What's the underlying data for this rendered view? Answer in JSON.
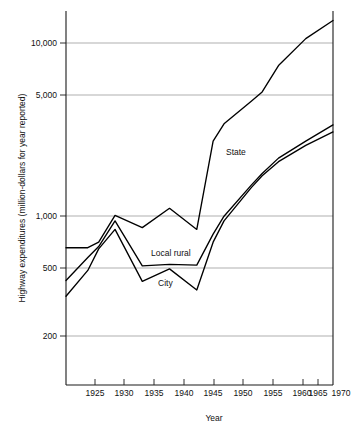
{
  "chart_data": {
    "type": "line",
    "title": "",
    "xlabel": "Year",
    "ylabel": "Highway expenditures (million-dollars for year reported)",
    "xlim": [
      1921,
      1970
    ],
    "ylim": [
      150,
      16000
    ],
    "yscale": "log",
    "grid": true,
    "legend_position": "inline-annotations",
    "ytick_labels": [
      "10,000",
      "5,000",
      "1,000",
      "500",
      "200"
    ],
    "ytick_values": [
      10000,
      5000,
      1000,
      500,
      200
    ],
    "xtick_labels": [
      "1925",
      "1930",
      "1935",
      "1940",
      "1945",
      "1950",
      "1955",
      "1960",
      "1965",
      "1970"
    ],
    "xtick_values": [
      1925,
      1930,
      1935,
      1940,
      1945,
      1950,
      1955,
      1960,
      1965,
      1970
    ],
    "x": [
      1921,
      1925,
      1927,
      1930,
      1935,
      1940,
      1945,
      1948,
      1950,
      1955,
      1957,
      1960,
      1965,
      1970
    ],
    "series": [
      {
        "name": "State",
        "label": "State",
        "values": [
          650,
          650,
          700,
          1000,
          850,
          1100,
          830,
          2700,
          3400,
          4600,
          5200,
          7400,
          10600,
          13500
        ]
      },
      {
        "name": "Local rural",
        "label": "Local rural",
        "values": [
          420,
          570,
          660,
          930,
          510,
          520,
          515,
          780,
          990,
          1500,
          1750,
          2150,
          2700,
          3350
        ]
      },
      {
        "name": "City",
        "label": "City",
        "values": [
          340,
          480,
          640,
          830,
          415,
          490,
          370,
          700,
          930,
          1450,
          1700,
          2050,
          2550,
          3050
        ]
      }
    ],
    "annotations": [
      {
        "text": "State",
        "x": 1947,
        "y": 1850
      },
      {
        "text": "Local rural",
        "x": 1936,
        "y": 620
      },
      {
        "text": "City",
        "x": 1937,
        "y": 400
      }
    ]
  },
  "axis": {
    "y_title": "Highway expenditures (million-dollars for year reported)",
    "x_title": "Year"
  },
  "yticks": {
    "t0": "10,000",
    "t1": "5,000",
    "t2": "1,000",
    "t3": "500",
    "t4": "200"
  },
  "xticks": {
    "t0": "1925",
    "t1": "1930",
    "t2": "1935",
    "t3": "1940",
    "t4": "1945",
    "t5": "1950",
    "t6": "1955",
    "t7": "1960",
    "t8": "1965",
    "t9": "1970"
  },
  "labels": {
    "state": "State",
    "local_rural": "Local rural",
    "city": "City"
  },
  "colors": {
    "line": "#000000",
    "grid": "#8c8c8c",
    "frame": "#1a1a1a",
    "background": "#ffffff",
    "text": "#111111"
  }
}
